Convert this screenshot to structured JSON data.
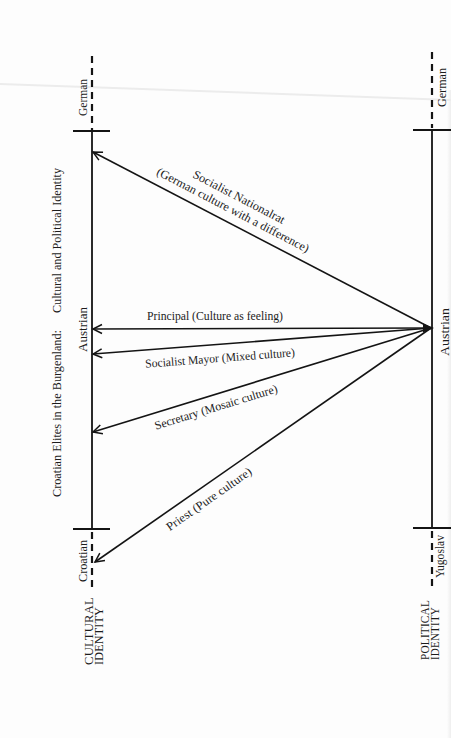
{
  "diagram": {
    "title_part1": "Croatian Elites in the Burgenland:",
    "title_part2": "Cultural and Political Identity",
    "cultural_axis": {
      "label_line1": "CULTURAL",
      "label_line2": "IDENTITY",
      "top": "German",
      "middle": "Austrian",
      "bottom": "Croatian"
    },
    "political_axis": {
      "label_line1": "POLITICAL",
      "label_line2": "IDENTITY",
      "top": "German",
      "middle": "Austrian",
      "bottom": "Yugoslav"
    },
    "arrows": [
      {
        "actor": "Socialist Nationalrat",
        "note": "(German culture with a difference)"
      },
      {
        "label": "Principal (Culture as feeling)"
      },
      {
        "label": "Socialist Mayor (Mixed culture)"
      },
      {
        "label": "Secretary (Mosaic culture)"
      },
      {
        "label": "Priest (Pure culture)"
      }
    ],
    "colors": {
      "ink": "#141414",
      "paper": "#fdfdfd"
    }
  }
}
